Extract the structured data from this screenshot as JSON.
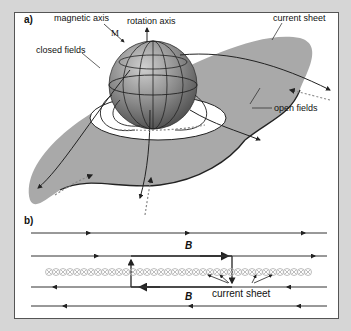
{
  "panel_a": {
    "label": "a)",
    "labels": {
      "magnetic_axis": "magnetic axis",
      "rotation_axis": "rotation axis",
      "magnetic_axis_symbol": "M",
      "closed_fields": "closed fields",
      "current_sheet": "current sheet",
      "open_fields": "open fields"
    }
  },
  "panel_b": {
    "label": "b)",
    "field_upper": "B",
    "field_lower": "B",
    "current_sheet": "current sheet"
  },
  "colors": {
    "background": "#d6d6d6",
    "frame": "#ffffff",
    "sheet": "#a9a9a9",
    "sphere": "#7a7a7a",
    "line": "#222222",
    "current_circles": "#b5b5b5"
  }
}
